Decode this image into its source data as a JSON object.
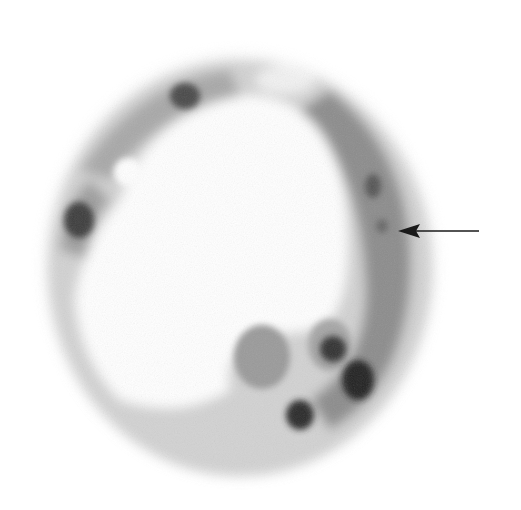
{
  "image": {
    "kind": "grayscale micrograph",
    "subject": "ring-shaped cyst with cellular wall and nuclei",
    "background_color": "#ffffff",
    "tissue_color": "#8a8a8a",
    "nucleus_color": "#2e2e2e"
  },
  "annotation": {
    "type": "arrow",
    "direction": "left",
    "tip": [
      398,
      231
    ],
    "tail": [
      479,
      231
    ],
    "color": "#1a1a1a"
  },
  "nuclei": [
    {
      "cx": 185,
      "cy": 96,
      "rx": 15,
      "ry": 13
    },
    {
      "cx": 79,
      "cy": 220,
      "rx": 15,
      "ry": 18
    },
    {
      "cx": 373,
      "cy": 186,
      "rx": 8,
      "ry": 12
    },
    {
      "cx": 382,
      "cy": 226,
      "rx": 6,
      "ry": 7
    },
    {
      "cx": 333,
      "cy": 349,
      "rx": 13,
      "ry": 13
    },
    {
      "cx": 358,
      "cy": 380,
      "rx": 16,
      "ry": 20
    },
    {
      "cx": 300,
      "cy": 415,
      "rx": 14,
      "ry": 15
    }
  ]
}
